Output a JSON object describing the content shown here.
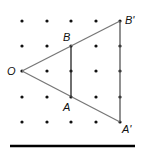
{
  "diagram": {
    "type": "dilation-on-dot-grid",
    "grid": {
      "columns_x": [
        22,
        47,
        71,
        96,
        120
      ],
      "rows_y": [
        21,
        46,
        71,
        97,
        122
      ],
      "dot_color": "#111111"
    },
    "points": {
      "O": {
        "label": "O",
        "x": 22,
        "y": 71
      },
      "B": {
        "label": "B",
        "x": 71,
        "y": 46
      },
      "A": {
        "label": "A",
        "x": 71,
        "y": 97
      },
      "B_prime": {
        "label": "B'",
        "x": 120,
        "y": 21
      },
      "A_prime": {
        "label": "A'",
        "x": 120,
        "y": 122
      }
    },
    "segments": [
      {
        "from": "O",
        "to": "B_prime",
        "color": "#777777"
      },
      {
        "from": "O",
        "to": "A_prime",
        "color": "#777777"
      },
      {
        "from": "B",
        "to": "A",
        "color": "#222222"
      },
      {
        "from": "B_prime",
        "to": "A_prime",
        "color": "#555555"
      }
    ],
    "bottom_rule": {
      "x1": 10,
      "x2": 135,
      "y": 146,
      "color": "#000000"
    }
  }
}
